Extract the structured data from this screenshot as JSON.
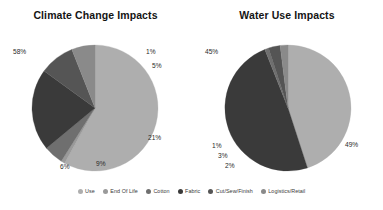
{
  "figure": {
    "background": "#ffffff",
    "charts": [
      {
        "id": "climate-change-impacts",
        "title": "Climate Change Impacts"
      },
      {
        "id": "water-use-impacts",
        "title": "Water Use Impacts"
      }
    ]
  },
  "legend": {
    "position": "bottom",
    "items": [
      {
        "label": "Use",
        "color": "#aeaeae"
      },
      {
        "label": "End Of Life",
        "color": "#9a9a9a"
      },
      {
        "label": "Cotton",
        "color": "#6f6f6f"
      },
      {
        "label": "Fabric",
        "color": "#3a3a3a"
      },
      {
        "label": "Cut/Sew/Finish",
        "color": "#555555"
      },
      {
        "label": "Logistics/Retail",
        "color": "#8a8a8a"
      }
    ]
  },
  "chart_data": [
    {
      "type": "pie",
      "title": "Climate Change Impacts",
      "xlabel": "",
      "ylabel": "",
      "legend_position": "bottom",
      "grid": false,
      "categories": [
        "Use",
        "End Of Life",
        "Cotton",
        "Fabric",
        "Cut/Sew/Finish",
        "Logistics/Retail"
      ],
      "values": [
        58,
        1,
        5,
        21,
        9,
        6
      ],
      "labels": [
        "58%",
        "1%",
        "5%",
        "21%",
        "9%",
        "6%"
      ],
      "colors": [
        "#aeaeae",
        "#9a9a9a",
        "#6f6f6f",
        "#3a3a3a",
        "#555555",
        "#8a8a8a"
      ],
      "start_angle_deg": -90,
      "direction": "clockwise"
    },
    {
      "type": "pie",
      "title": "Water Use Impacts",
      "xlabel": "",
      "ylabel": "",
      "legend_position": "bottom",
      "grid": false,
      "categories": [
        "Use",
        "End Of Life",
        "Cotton",
        "Fabric",
        "Cut/Sew/Finish",
        "Logistics/Retail"
      ],
      "values": [
        45,
        49,
        1,
        3,
        2
      ],
      "labels": [
        "45%",
        "49%",
        "1%",
        "3%",
        "2%"
      ],
      "colors": [
        "#aeaeae",
        "#3a3a3a",
        "#6f6f6f",
        "#555555",
        "#8a8a8a"
      ],
      "start_angle_deg": -90,
      "direction": "clockwise"
    }
  ],
  "annotations": {
    "left": {
      "p58": "58%",
      "p1": "1%",
      "p5": "5%",
      "p21": "21%",
      "p9": "9%",
      "p6": "6%"
    },
    "right": {
      "p45": "45%",
      "p49": "49%",
      "p1": "1%",
      "p3": "3%",
      "p2": "2%"
    }
  }
}
